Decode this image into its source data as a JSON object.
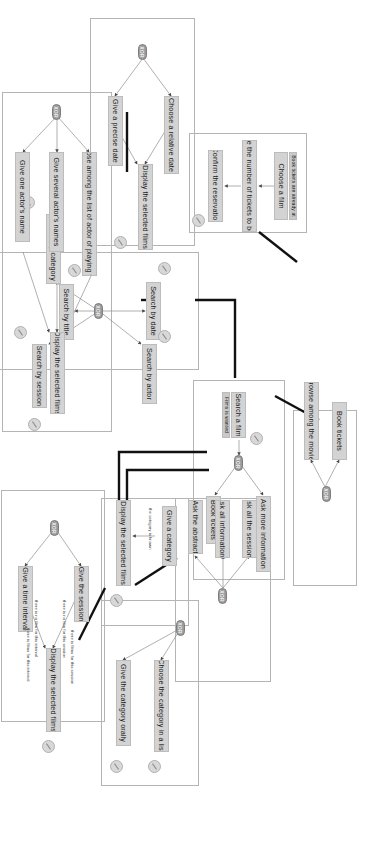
{
  "diagram": {
    "type": "hierarchical-task-tree",
    "colors": {
      "node_fill": "#d3d3d3",
      "node_border": "#bcbcbc",
      "operator_fill": "#9a9a9a",
      "group_border": "#b4b4b4",
      "thick_link": "#111111",
      "thin_link": "#8e8e8e",
      "background": "#ffffff"
    },
    "operators": {
      "xor": "XOR"
    },
    "groups": [
      {
        "id": "g_browse",
        "name": "browse-group"
      },
      {
        "id": "g_book",
        "name": "book-tickets-group"
      },
      {
        "id": "g_searchfilm",
        "name": "search-a-film-group"
      },
      {
        "id": "g_date",
        "name": "search-by-date-group"
      },
      {
        "id": "g_search",
        "name": "search-options-group"
      },
      {
        "id": "g_actor",
        "name": "search-by-actor-group"
      },
      {
        "id": "g_sessions",
        "name": "ask-informations-group"
      },
      {
        "id": "g_category",
        "name": "search-by-category-group"
      },
      {
        "id": "g_catlist",
        "name": "choose-category-group"
      },
      {
        "id": "g_session",
        "name": "search-by-session-group"
      }
    ],
    "nodes": [
      {
        "id": "n_browse",
        "label": "Browse among the movies"
      },
      {
        "id": "n_booktix1",
        "label": "Book tickets"
      },
      {
        "id": "n_choosefilm_hint",
        "label": "Book tickets are already at"
      },
      {
        "id": "n_choosefilm",
        "label": "Choose a film"
      },
      {
        "id": "n_nbtickets",
        "label": "Give the number of tickets to book"
      },
      {
        "id": "n_confirm",
        "label": "Confirm the reservation"
      },
      {
        "id": "n_searchfilm",
        "label": "Search a film"
      },
      {
        "id": "n_searchfilm_hint",
        "label": "Films is wanted"
      },
      {
        "id": "n_askmore",
        "label": "Ask more information"
      },
      {
        "id": "n_booktix2",
        "label": "Book tickets"
      },
      {
        "id": "n_sbdate",
        "label": "Search by date"
      },
      {
        "id": "n_sbactor",
        "label": "Search by actor"
      },
      {
        "id": "n_sbtitle",
        "label": "Search by title"
      },
      {
        "id": "n_sbcat",
        "label": "Search by category"
      },
      {
        "id": "n_sbsess",
        "label": "Search by session"
      },
      {
        "id": "n_reldate",
        "label": "Choose a relative date"
      },
      {
        "id": "n_precdate",
        "label": "Give a precise date"
      },
      {
        "id": "n_dispdate",
        "label": "Display the selected films"
      },
      {
        "id": "n_chooseactor",
        "label": "Choose among the list of actor of playing films"
      },
      {
        "id": "n_sevnames",
        "label": "Give several actor's names"
      },
      {
        "id": "n_onename",
        "label": "Give one actor's name"
      },
      {
        "id": "n_dispactor",
        "label": "Display the selected films"
      },
      {
        "id": "n_asksess",
        "label": "Ask all the sessions"
      },
      {
        "id": "n_askinfo",
        "label": "Ask all informations"
      },
      {
        "id": "n_askabs",
        "label": "Ask the abstract"
      },
      {
        "id": "n_givecat",
        "label": "Give a category"
      },
      {
        "id": "n_dispcat",
        "label": "Display the selected films"
      },
      {
        "id": "n_choosecat",
        "label": "Choose the category in a list"
      },
      {
        "id": "n_catorally",
        "label": "Give the category orally"
      },
      {
        "id": "n_givesess",
        "label": "Give the session"
      },
      {
        "id": "n_interval",
        "label": "Give a time interval"
      },
      {
        "id": "n_dispsess",
        "label": "Display the selected films"
      }
    ],
    "edge_labels": {
      "category_known": "the category is known",
      "no_film_session": "there is no film for this session",
      "films_session": "there is films for this session",
      "no_film_interval": "there is no film for this interval",
      "films_interval": "there is films for this interval"
    }
  }
}
